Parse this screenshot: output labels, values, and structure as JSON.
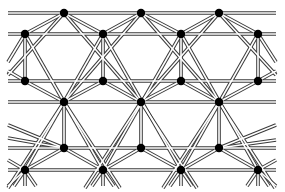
{
  "diagram": {
    "type": "lattice-truss",
    "colors": {
      "bar": "#3a3a3a",
      "bar_gap": "#ffffff",
      "node": "#000000",
      "background": "#ffffff"
    },
    "node_radius": 4.2,
    "x_extent": [
      8,
      276
    ],
    "rows": [
      {
        "y": 13,
        "xs": [
          64,
          141,
          219
        ]
      },
      {
        "y": 34,
        "xs": [
          25,
          103,
          181,
          258
        ]
      },
      {
        "y": 81,
        "xs": [
          25,
          103,
          181,
          258
        ]
      },
      {
        "y": 102,
        "xs": [
          64,
          141,
          219
        ]
      },
      {
        "y": 148,
        "xs": [
          64,
          141,
          219
        ]
      },
      {
        "y": 170,
        "xs": [
          25,
          103,
          181,
          258
        ]
      }
    ],
    "edges": [
      [
        64,
        13,
        141,
        102
      ],
      [
        141,
        13,
        64,
        102
      ],
      [
        141,
        13,
        219,
        102
      ],
      [
        219,
        13,
        141,
        102
      ],
      [
        64,
        13,
        8,
        75
      ],
      [
        219,
        13,
        276,
        75
      ],
      [
        64,
        13,
        25,
        34
      ],
      [
        64,
        13,
        103,
        34
      ],
      [
        141,
        13,
        103,
        34
      ],
      [
        141,
        13,
        181,
        34
      ],
      [
        219,
        13,
        181,
        34
      ],
      [
        219,
        13,
        258,
        34
      ],
      [
        25,
        34,
        103,
        170
      ],
      [
        103,
        34,
        25,
        170
      ],
      [
        103,
        34,
        181,
        170
      ],
      [
        181,
        34,
        103,
        170
      ],
      [
        181,
        34,
        258,
        170
      ],
      [
        258,
        34,
        181,
        170
      ],
      [
        25,
        34,
        8,
        62
      ],
      [
        258,
        34,
        276,
        62
      ],
      [
        25,
        34,
        25,
        81
      ],
      [
        103,
        34,
        103,
        81
      ],
      [
        181,
        34,
        181,
        81
      ],
      [
        258,
        34,
        258,
        81
      ],
      [
        25,
        81,
        64,
        102
      ],
      [
        103,
        81,
        64,
        102
      ],
      [
        103,
        81,
        141,
        102
      ],
      [
        181,
        81,
        141,
        102
      ],
      [
        181,
        81,
        219,
        102
      ],
      [
        258,
        81,
        219,
        102
      ],
      [
        25,
        81,
        8,
        71
      ],
      [
        258,
        81,
        276,
        71
      ],
      [
        64,
        102,
        64,
        148
      ],
      [
        141,
        102,
        141,
        148
      ],
      [
        219,
        102,
        219,
        148
      ],
      [
        64,
        102,
        8,
        188
      ],
      [
        64,
        102,
        120,
        188
      ],
      [
        141,
        102,
        85,
        188
      ],
      [
        141,
        102,
        197,
        188
      ],
      [
        219,
        102,
        163,
        188
      ],
      [
        219,
        102,
        275,
        188
      ],
      [
        64,
        148,
        25,
        170
      ],
      [
        64,
        148,
        103,
        170
      ],
      [
        141,
        148,
        103,
        170
      ],
      [
        141,
        148,
        181,
        170
      ],
      [
        219,
        148,
        181,
        170
      ],
      [
        219,
        148,
        258,
        170
      ],
      [
        64,
        148,
        8,
        138
      ],
      [
        219,
        148,
        276,
        140
      ],
      [
        25,
        170,
        8,
        160
      ],
      [
        258,
        170,
        276,
        160
      ],
      [
        25,
        170,
        8,
        186
      ],
      [
        258,
        170,
        276,
        186
      ],
      [
        64,
        148,
        8,
        125
      ],
      [
        219,
        148,
        276,
        125
      ],
      [
        25,
        170,
        25,
        186
      ],
      [
        103,
        170,
        103,
        186
      ],
      [
        181,
        170,
        181,
        186
      ],
      [
        258,
        170,
        258,
        186
      ],
      [
        25,
        170,
        14,
        186
      ],
      [
        103,
        170,
        92,
        186
      ],
      [
        181,
        170,
        170,
        186
      ],
      [
        258,
        170,
        247,
        186
      ],
      [
        25,
        170,
        36,
        186
      ],
      [
        103,
        170,
        114,
        186
      ],
      [
        181,
        170,
        192,
        186
      ],
      [
        258,
        170,
        269,
        186
      ]
    ]
  }
}
